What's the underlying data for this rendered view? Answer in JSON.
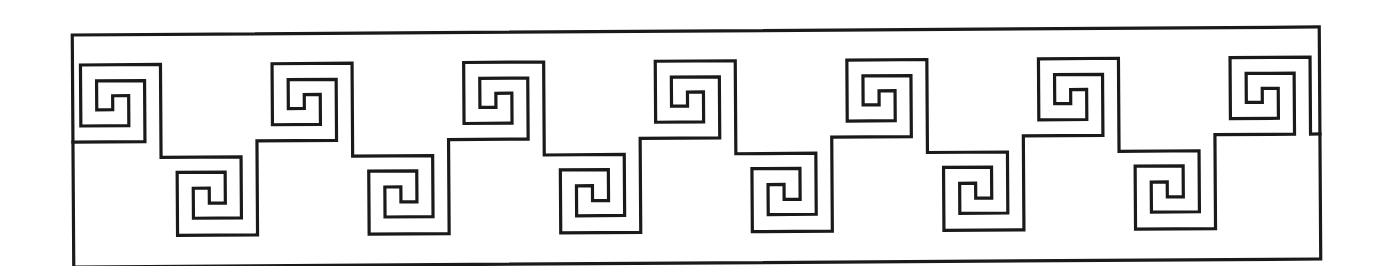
{
  "figure": {
    "title": "Greek key (meander) border pattern",
    "stroke_color": "#1a1a1a",
    "background_color": "#ffffff",
    "stroke_width": 3.2,
    "tilt_degrees": -0.37,
    "frame": {
      "left": 73,
      "top": 31,
      "right": 1320,
      "bottom": 263
    },
    "motif": {
      "period_px": 191.6,
      "upper_spiral_count": 7,
      "lower_spiral_count": 6,
      "first_upper_spiral_left": 81
    }
  }
}
